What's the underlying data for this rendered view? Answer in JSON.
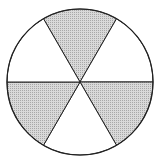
{
  "diagram": {
    "type": "fraction-circle",
    "total_sectors": 6,
    "shaded_sectors": 3,
    "shaded_indices": [
      0,
      2,
      4
    ],
    "shade_color": "#c8c8c8",
    "stroke_color": "#222222",
    "background": "#ffffff",
    "center": [
      80,
      82
    ],
    "radius": 73
  }
}
